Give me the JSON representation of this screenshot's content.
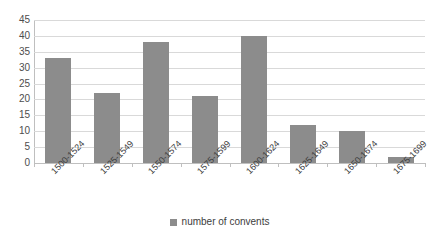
{
  "chart_data": {
    "type": "bar",
    "title": "",
    "subtitle": "",
    "xlabel": "",
    "ylabel": "",
    "categories": [
      "1500-1524",
      "1525-1549",
      "1550-1574",
      "1575-1599",
      "1600-1624",
      "1625-1649",
      "1650-1674",
      "1675-1699"
    ],
    "values": [
      33,
      22,
      38,
      21,
      40,
      12,
      10,
      2
    ],
    "series": [
      {
        "name": "number of convents",
        "values": [
          33,
          22,
          38,
          21,
          40,
          12,
          10,
          2
        ]
      }
    ],
    "ylim": [
      0,
      45
    ],
    "ytick_labels": [
      "0",
      "5",
      "10",
      "15",
      "20",
      "25",
      "30",
      "35",
      "40",
      "45"
    ],
    "ytick_values": [
      0,
      5,
      10,
      15,
      20,
      25,
      30,
      35,
      40,
      45
    ],
    "ytick_step": 5,
    "grid": "horizontal",
    "legend_position": "bottom",
    "legend_entries": [
      "number of convents"
    ],
    "bar_color": "#8c8c8c",
    "gridline_color": "#d9d9d9",
    "axis_color": "#bfbfbf",
    "background_color": "#ffffff",
    "xlabel_rotation": -45,
    "annotations": []
  },
  "legend": {
    "swatch_name": "legend-color-swatch",
    "label": "number of convents"
  }
}
